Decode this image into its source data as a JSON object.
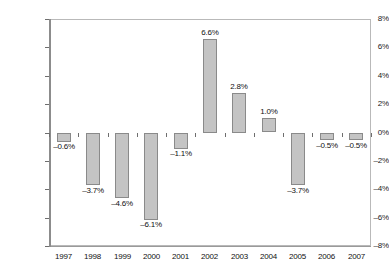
{
  "chart_data": {
    "type": "bar",
    "title": "",
    "subtitle": "",
    "xlabel": "",
    "ylabel": "",
    "categories": [
      "1997",
      "1998",
      "1999",
      "2000",
      "2001",
      "2002",
      "2003",
      "2004",
      "2005",
      "2006",
      "2007"
    ],
    "values": [
      -0.6,
      -3.7,
      -4.6,
      -6.1,
      -1.1,
      6.6,
      2.8,
      1.0,
      -3.7,
      -0.5,
      -0.5
    ],
    "data_labels": [
      "-0.6%",
      "-3.7%",
      "-4.6%",
      "-6.1%",
      "-1.1%",
      "6.6%",
      "2.8%",
      "1.0%",
      "-3.7%",
      "-0.5%",
      "-0.5%"
    ],
    "ylim": [
      -8,
      8
    ],
    "ytick_values": [
      8,
      6,
      4,
      2,
      0,
      -2,
      -4,
      -6,
      -8
    ],
    "ytick_labels": [
      "8%",
      "6%",
      "4%",
      "2%",
      "0%",
      "-2%",
      "-4%",
      "-6%",
      "-8%"
    ],
    "grid": true,
    "legend": false,
    "legend_position": "none",
    "series_name": "",
    "colors": {
      "bar_fill": "#c4c4c4",
      "bar_border": "#8a8a8a",
      "gridline": "#9a9a9a",
      "axis": "#6e6e6e",
      "plot_border": "#b9b9b9",
      "text": "#111111",
      "background": "#ffffff"
    }
  }
}
